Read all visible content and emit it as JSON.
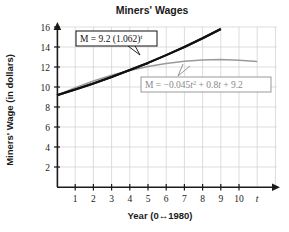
{
  "chart_data": {
    "type": "line",
    "title": "Miners' Wages",
    "xlabel": "Year (0↔1980)",
    "ylabel": "Miners' Wage (in dollars)",
    "x_axis_variable": "t",
    "xlim": [
      0,
      11
    ],
    "ylim": [
      0,
      16
    ],
    "xticks": [
      "1",
      "2",
      "3",
      "4",
      "5",
      "6",
      "7",
      "8",
      "9",
      "10"
    ],
    "xtick_values": [
      1,
      2,
      3,
      4,
      5,
      6,
      7,
      8,
      9,
      10
    ],
    "yticks": [
      "2",
      "4",
      "6",
      "8",
      "10",
      "12",
      "14",
      "16"
    ],
    "ytick_values": [
      2,
      4,
      6,
      8,
      10,
      12,
      14,
      16
    ],
    "grid": true,
    "legend_position": "inline-annotations",
    "series": [
      {
        "name": "exponential-model",
        "equation": "M = 9.2 (1.062)^t",
        "color": "#111111",
        "x": [
          0,
          1,
          2,
          3,
          4,
          5,
          6,
          7,
          8,
          9
        ],
        "values": [
          9.2,
          9.77,
          10.38,
          11.02,
          11.71,
          12.43,
          13.21,
          14.02,
          14.89,
          15.82
        ]
      },
      {
        "name": "quadratic-model",
        "equation": "M = -0.045t^2 + 0.8t + 9.2",
        "color": "#9a9a9a",
        "x": [
          0,
          1,
          2,
          3,
          4,
          5,
          6,
          7,
          8,
          9,
          10,
          11
        ],
        "values": [
          9.2,
          9.96,
          10.62,
          11.2,
          11.68,
          12.08,
          12.38,
          12.6,
          12.72,
          12.76,
          12.7,
          12.56
        ]
      }
    ],
    "annotations": [
      {
        "name": "exponential-equation-label",
        "text": "M = 9.2 (1.062)t",
        "text_parts": {
          "lead": "M = 9.2 (1.062)",
          "exponent": "t"
        },
        "color": "#111111"
      },
      {
        "name": "quadratic-equation-label",
        "text": "M = −0.045t2 + 0.8t + 9.2",
        "text_parts": {
          "lead": "M = −0.045",
          "var1": "t",
          "power": "2",
          "mid": " + 0.8",
          "var2": "t",
          "tail": " + 9.2"
        },
        "color": "#8a8a8a"
      }
    ]
  }
}
